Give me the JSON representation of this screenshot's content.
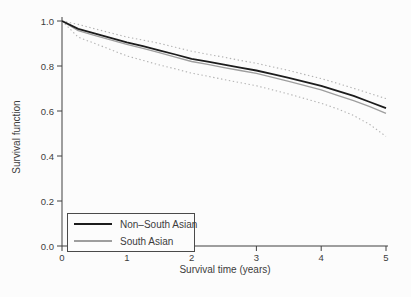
{
  "page": {
    "background": "#fcfcfc"
  },
  "chart_data": {
    "type": "line",
    "title": "",
    "xlabel": "Survival time (years)",
    "ylabel": "Survival function",
    "xlim": [
      0,
      5
    ],
    "ylim": [
      0,
      1
    ],
    "grid": false,
    "x_ticks": {
      "values": [
        0,
        1,
        2,
        3,
        4,
        5
      ],
      "labels": [
        "0",
        "1",
        "2",
        "3",
        "4",
        "5"
      ]
    },
    "y_ticks": {
      "values": [
        0,
        0.2,
        0.4,
        0.6,
        0.8,
        1
      ],
      "labels": [
        "0.0",
        "0.2",
        "0.4",
        "0.6",
        "0.8",
        "1.0"
      ]
    },
    "legend": {
      "position": "bottom-left",
      "border": true
    },
    "colors": {
      "axis": "#404040",
      "text": "#3c3c3c",
      "non_south_asian": "#1c1c1c",
      "south_asian": "#9e9e9e",
      "confidence_interval": "#b2b2b2"
    },
    "x": [
      0,
      0.25,
      0.5,
      0.75,
      1,
      1.25,
      1.5,
      1.75,
      2,
      2.25,
      2.5,
      2.75,
      3,
      3.25,
      3.5,
      3.75,
      4,
      4.25,
      4.5,
      4.75,
      5
    ],
    "series": [
      {
        "id": "non-south-asian",
        "label": "Non–South Asian",
        "style": "solid",
        "color": "#1c1c1c",
        "width": 1.8,
        "values": [
          1.0,
          0.965,
          0.945,
          0.925,
          0.905,
          0.888,
          0.87,
          0.851,
          0.832,
          0.819,
          0.806,
          0.793,
          0.78,
          0.764,
          0.747,
          0.73,
          0.712,
          0.69,
          0.667,
          0.64,
          0.613
        ]
      },
      {
        "id": "south-asian",
        "label": "South Asian",
        "style": "solid",
        "color": "#9e9e9e",
        "width": 1.3,
        "values": [
          1.0,
          0.957,
          0.936,
          0.916,
          0.896,
          0.878,
          0.859,
          0.839,
          0.82,
          0.807,
          0.793,
          0.78,
          0.767,
          0.75,
          0.732,
          0.713,
          0.694,
          0.67,
          0.646,
          0.619,
          0.59
        ]
      },
      {
        "id": "ci-upper",
        "label": "",
        "style": "dotted",
        "color": "#b2b2b2",
        "width": 1.1,
        "values": [
          1.0,
          0.985,
          0.966,
          0.947,
          0.929,
          0.915,
          0.901,
          0.883,
          0.866,
          0.852,
          0.839,
          0.825,
          0.812,
          0.796,
          0.78,
          0.762,
          0.744,
          0.723,
          0.701,
          0.678,
          0.655
        ]
      },
      {
        "id": "ci-lower",
        "label": "",
        "style": "dotted",
        "color": "#b2b2b2",
        "width": 1.1,
        "values": [
          1.0,
          0.928,
          0.901,
          0.873,
          0.845,
          0.825,
          0.805,
          0.787,
          0.768,
          0.754,
          0.74,
          0.726,
          0.712,
          0.694,
          0.675,
          0.655,
          0.634,
          0.61,
          0.58,
          0.54,
          0.487
        ]
      }
    ]
  }
}
